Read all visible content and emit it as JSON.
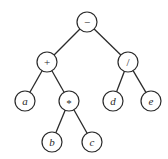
{
  "diagram": {
    "type": "expression-tree",
    "node_radius": 10,
    "colors": {
      "stroke": "#2a2a2a",
      "fill": "#ffffff",
      "background": "#ffffff"
    },
    "nodes": [
      {
        "id": "root",
        "label": "−",
        "kind": "operator",
        "x": 87,
        "y": 22
      },
      {
        "id": "plus",
        "label": "+",
        "kind": "operator",
        "x": 47,
        "y": 62
      },
      {
        "id": "div",
        "label": "/",
        "kind": "operator",
        "x": 128,
        "y": 62
      },
      {
        "id": "a",
        "label": "a",
        "kind": "variable",
        "x": 25,
        "y": 101
      },
      {
        "id": "mul",
        "label": "*",
        "kind": "operator",
        "x": 69,
        "y": 101
      },
      {
        "id": "d",
        "label": "d",
        "kind": "variable",
        "x": 113,
        "y": 101
      },
      {
        "id": "e",
        "label": "e",
        "kind": "variable",
        "x": 151,
        "y": 101
      },
      {
        "id": "b",
        "label": "b",
        "kind": "variable",
        "x": 52,
        "y": 142
      },
      {
        "id": "c",
        "label": "c",
        "kind": "variable",
        "x": 92,
        "y": 142
      }
    ],
    "edges": [
      {
        "from": "root",
        "to": "plus"
      },
      {
        "from": "root",
        "to": "div"
      },
      {
        "from": "plus",
        "to": "a"
      },
      {
        "from": "plus",
        "to": "mul"
      },
      {
        "from": "div",
        "to": "d"
      },
      {
        "from": "div",
        "to": "e"
      },
      {
        "from": "mul",
        "to": "b"
      },
      {
        "from": "mul",
        "to": "c"
      }
    ]
  }
}
